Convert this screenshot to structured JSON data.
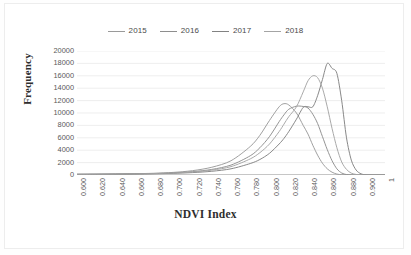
{
  "chart_data": {
    "type": "line",
    "title": "",
    "xlabel": "NDVI Index",
    "ylabel": "Frequency",
    "xlim": [
      0.6,
      0.92
    ],
    "ylim": [
      0,
      20000
    ],
    "grid": "horizontal",
    "legend_position": "top-center",
    "x_tick_labels": [
      "0.600",
      "0.620",
      "0.640",
      "0.660",
      "0.680",
      "0.700",
      "0.720",
      "0.740",
      "0.760",
      "0.780",
      "0.800",
      "0.820",
      "0.840",
      "0.860",
      "0.880",
      "0.900",
      "1"
    ],
    "x_tick_values": [
      0.6,
      0.62,
      0.64,
      0.66,
      0.68,
      0.7,
      0.72,
      0.74,
      0.76,
      0.78,
      0.8,
      0.82,
      0.84,
      0.86,
      0.88,
      0.9,
      0.92
    ],
    "y_tick_labels": [
      "0",
      "2000",
      "4000",
      "6000",
      "8000",
      "10000",
      "12000",
      "14000",
      "16000",
      "18000",
      "20000"
    ],
    "y_tick_values": [
      0,
      2000,
      4000,
      6000,
      8000,
      10000,
      12000,
      14000,
      16000,
      18000,
      20000
    ],
    "x": [
      0.6,
      0.62,
      0.64,
      0.66,
      0.68,
      0.7,
      0.72,
      0.74,
      0.76,
      0.78,
      0.79,
      0.8,
      0.81,
      0.815,
      0.82,
      0.828,
      0.835,
      0.84,
      0.845,
      0.85,
      0.855,
      0.86,
      0.865,
      0.87,
      0.875,
      0.88,
      0.885,
      0.89,
      0.895,
      0.9,
      0.91,
      0.92
    ],
    "series": [
      {
        "name": "2015",
        "color": "#9a9a9a",
        "peak_value": 11500,
        "peak_x": 0.815,
        "values": [
          120,
          140,
          170,
          210,
          280,
          420,
          700,
          1250,
          2300,
          4600,
          6400,
          8800,
          11000,
          11500,
          11300,
          10000,
          8000,
          6600,
          4800,
          3200,
          1900,
          1000,
          450,
          150,
          40,
          10,
          0,
          0,
          0,
          0,
          0,
          0
        ]
      },
      {
        "name": "2016",
        "color": "#8e8e8e",
        "peak_value": 11100,
        "peak_x": 0.828,
        "values": [
          110,
          125,
          150,
          185,
          240,
          340,
          540,
          900,
          1600,
          3100,
          4400,
          6200,
          8600,
          9700,
          10600,
          11100,
          11050,
          10800,
          9800,
          8300,
          6200,
          4100,
          2300,
          1000,
          320,
          70,
          10,
          0,
          0,
          0,
          0,
          0
        ]
      },
      {
        "name": "2017",
        "color": "#828282",
        "peak_value": 18000,
        "peak_x": 0.86,
        "values": [
          100,
          110,
          130,
          160,
          200,
          270,
          390,
          600,
          1000,
          1850,
          2500,
          3500,
          5000,
          5900,
          7000,
          9000,
          10900,
          11000,
          11000,
          12800,
          15400,
          18000,
          17200,
          16400,
          12000,
          6000,
          2400,
          800,
          200,
          40,
          0,
          0
        ]
      },
      {
        "name": "2018",
        "color": "#a4a4a4",
        "peak_value": 16000,
        "peak_x": 0.845,
        "values": [
          105,
          118,
          140,
          175,
          230,
          320,
          480,
          780,
          1350,
          2600,
          3600,
          5000,
          7000,
          8200,
          9400,
          11000,
          13400,
          15200,
          16000,
          15700,
          14000,
          11000,
          7500,
          4400,
          2100,
          900,
          300,
          90,
          20,
          5,
          0,
          0
        ]
      }
    ]
  },
  "legend": {
    "items": [
      {
        "label": "2015"
      },
      {
        "label": "2016"
      },
      {
        "label": "2017"
      },
      {
        "label": "2018"
      }
    ]
  }
}
